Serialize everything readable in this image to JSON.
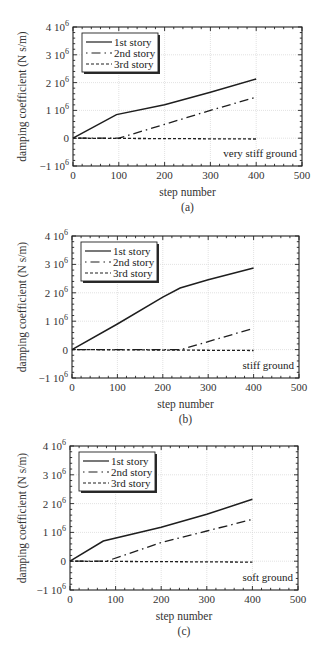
{
  "figure": {
    "panels": [
      {
        "caption": "(a)",
        "annotation": "very stiff ground"
      },
      {
        "caption": "(b)",
        "annotation": "stiff ground"
      },
      {
        "caption": "(c)",
        "annotation": "soft ground"
      }
    ]
  },
  "chart_data": [
    {
      "type": "line",
      "title": "",
      "caption": "(a)",
      "annotation": "very stiff ground",
      "xlabel": "step number",
      "ylabel": "damping coefficient (N s/m)",
      "xlim": [
        0,
        500
      ],
      "ylim": [
        -1000000,
        4000000
      ],
      "xticks": [
        0,
        100,
        200,
        300,
        400,
        500
      ],
      "yticks": [
        -1000000,
        0,
        1000000,
        2000000,
        3000000,
        4000000
      ],
      "ytick_labels": [
        "−1 10^6",
        "0",
        "1 10^6",
        "2 10^6",
        "3 10^6",
        "4 10^6"
      ],
      "grid": true,
      "legend_position": "upper left",
      "series": [
        {
          "name": "1st story",
          "style": "solid",
          "x": [
            0,
            95,
            200,
            300,
            400
          ],
          "y": [
            0,
            850000,
            1200000,
            1650000,
            2130000
          ]
        },
        {
          "name": "2nd story",
          "style": "dash-dot",
          "x": [
            0,
            100,
            200,
            300,
            400
          ],
          "y": [
            0,
            0,
            500000,
            1000000,
            1480000
          ]
        },
        {
          "name": "3rd story",
          "style": "dashed",
          "x": [
            0,
            400
          ],
          "y": [
            0,
            -30000
          ]
        }
      ]
    },
    {
      "type": "line",
      "title": "",
      "caption": "(b)",
      "annotation": "stiff ground",
      "xlabel": "step number",
      "ylabel": "damping coefficient (N s/m)",
      "xlim": [
        0,
        500
      ],
      "ylim": [
        -1000000,
        4000000
      ],
      "xticks": [
        0,
        100,
        200,
        300,
        400,
        500
      ],
      "yticks": [
        -1000000,
        0,
        1000000,
        2000000,
        3000000,
        4000000
      ],
      "ytick_labels": [
        "−1 10^6",
        "0",
        "1 10^6",
        "2 10^6",
        "3 10^6",
        "4 10^6"
      ],
      "grid": true,
      "legend_position": "upper left",
      "series": [
        {
          "name": "1st story",
          "style": "solid",
          "x": [
            0,
            100,
            200,
            238,
            300,
            400
          ],
          "y": [
            0,
            900000,
            1850000,
            2170000,
            2460000,
            2870000
          ]
        },
        {
          "name": "2nd story",
          "style": "dash-dot",
          "x": [
            0,
            240,
            300,
            400
          ],
          "y": [
            0,
            0,
            280000,
            750000
          ]
        },
        {
          "name": "3rd story",
          "style": "dashed",
          "x": [
            0,
            400
          ],
          "y": [
            0,
            -30000
          ]
        }
      ]
    },
    {
      "type": "line",
      "title": "",
      "caption": "(c)",
      "annotation": "soft ground",
      "xlabel": "step number",
      "ylabel": "damping coefficient (N s/m)",
      "xlim": [
        0,
        500
      ],
      "ylim": [
        -1000000,
        4000000
      ],
      "xticks": [
        0,
        100,
        200,
        300,
        400,
        500
      ],
      "yticks": [
        -1000000,
        0,
        1000000,
        2000000,
        3000000,
        4000000
      ],
      "ytick_labels": [
        "−1 10^6",
        "0",
        "1 10^6",
        "2 10^6",
        "3 10^6",
        "4 10^6"
      ],
      "grid": true,
      "legend_position": "upper left",
      "series": [
        {
          "name": "1st story",
          "style": "solid",
          "x": [
            0,
            73,
            200,
            300,
            400
          ],
          "y": [
            0,
            700000,
            1180000,
            1630000,
            2150000
          ]
        },
        {
          "name": "2nd story",
          "style": "dash-dot",
          "x": [
            0,
            80,
            200,
            300,
            400
          ],
          "y": [
            0,
            0,
            650000,
            1050000,
            1450000
          ]
        },
        {
          "name": "3rd story",
          "style": "dashed",
          "x": [
            0,
            400
          ],
          "y": [
            0,
            -30000
          ]
        }
      ]
    }
  ]
}
